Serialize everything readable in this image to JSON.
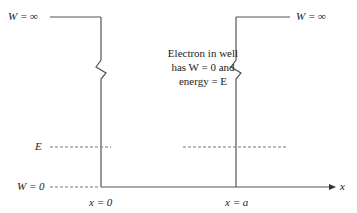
{
  "diagram": {
    "type": "infinite-potential-well",
    "labels": {
      "top_left": "W = ∞",
      "top_right": "W = ∞",
      "energy_level": "E",
      "zero_level": "W = 0",
      "left_wall_position": "x = 0",
      "right_wall_position": "x = a",
      "axis": "x"
    },
    "caption_lines": [
      "Electron in well",
      "has W = 0 and",
      "energy = E"
    ],
    "colors": {
      "line": "#555555",
      "dashed": "#777777",
      "text": "#222222"
    }
  }
}
